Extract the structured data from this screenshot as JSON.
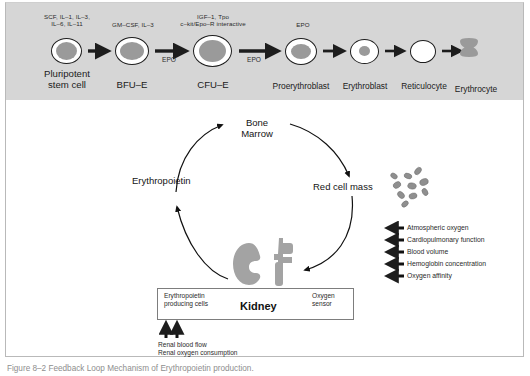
{
  "figure": {
    "caption": "Figure 8–2  Feedback Loop Mechanism of Erythropoietin production.",
    "banner_color": "#d6d6d6",
    "cell_fill_color": "#9a9a9a",
    "ink_color": "#1d1d1d"
  },
  "lineage": {
    "stages": [
      {
        "id": "pluripotent-stem-cell",
        "label_line1": "Pluripotent",
        "label_line2": "stem cell"
      },
      {
        "id": "bfu-e",
        "label_line1": "BFU–E",
        "label_line2": ""
      },
      {
        "id": "cfu-e",
        "label_line1": "CFU–E",
        "label_line2": ""
      },
      {
        "id": "proerythroblast",
        "label_line1": "Proerythroblast",
        "label_line2": ""
      },
      {
        "id": "erythroblast",
        "label_line1": "Erythroblast",
        "label_line2": ""
      },
      {
        "id": "reticulocyte",
        "label_line1": "Reticulocyte",
        "label_line2": ""
      },
      {
        "id": "erythrocyte",
        "label_line1": "Erythrocyte",
        "label_line2": ""
      }
    ],
    "cytokines": [
      {
        "id": "cytokines-stem",
        "line1": "SCF, IL–1, IL–3,",
        "line2": "IL–6, IL–11"
      },
      {
        "id": "cytokines-bfue",
        "line1": "GM–CSF, IL–3",
        "line2": ""
      },
      {
        "id": "cytokines-cfue",
        "line1": "IGF–1, Tpo",
        "line2": "c–kit/Epo–R interactive"
      },
      {
        "id": "cytokines-proery",
        "line1": "EPO",
        "line2": ""
      }
    ],
    "epo_arrow_tags": [
      {
        "id": "epo-tag-bfue-to-cfue",
        "label": "EPO"
      },
      {
        "id": "epo-tag-cfue-to-proery",
        "label": "EPO"
      }
    ]
  },
  "cycle": {
    "bone_marrow_line1": "Bone",
    "bone_marrow_line2": "Marrow",
    "erythropoietin": "Erythropoietin",
    "red_cell_mass": "Red cell mass"
  },
  "factors": [
    "Atmospheric oxygen",
    "Cardiopulmonary function",
    "Blood volume",
    "Hemoglobin concentration",
    "Oxygen affinity"
  ],
  "kidney": {
    "title": "Kidney",
    "left_label_line1": "Erythropoietin",
    "left_label_line2": "producing cells",
    "right_label_line1": "Oxygen",
    "right_label_line2": "sensor",
    "inputs": [
      "Renal blood flow",
      "Renal oxygen consumption"
    ]
  }
}
